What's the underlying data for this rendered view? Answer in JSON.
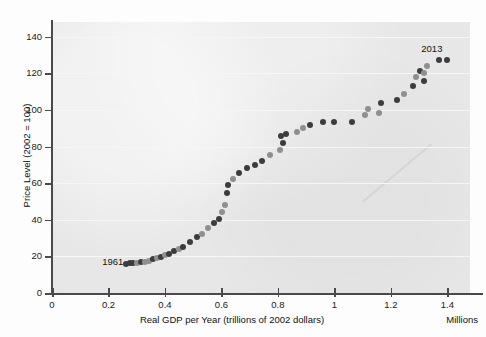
{
  "chart_data": {
    "type": "scatter",
    "title": "",
    "xlabel": "Real GDP per Year (trillions of 2002 dollars)",
    "xunit": "Millions",
    "ylabel": "Price Level (2002 = 100)",
    "xlim": [
      0,
      1.48
    ],
    "ylim": [
      0,
      148
    ],
    "xticks": [
      0,
      0.2,
      0.4,
      0.6,
      0.8,
      1,
      1.2,
      1.4
    ],
    "xtick_labels": [
      "0",
      "0.2",
      "0.4",
      "0.6",
      "0.8",
      "1",
      "1.2",
      "1.4"
    ],
    "yticks": [
      0,
      20,
      40,
      60,
      80,
      100,
      120,
      140
    ],
    "ytick_labels": [
      "0",
      "20",
      "40",
      "60",
      "80",
      "100",
      "120",
      "140"
    ],
    "grid": "horizontal",
    "legend": "none",
    "marker_colors": [
      "#3c3c3c",
      "#8f8f8f"
    ],
    "annotations": [
      {
        "label": "1961",
        "x": 0.215,
        "y": 17.5
      },
      {
        "label": "2013",
        "x": 1.345,
        "y": 134.0
      }
    ],
    "series": [
      {
        "name": "Price level vs real GDP",
        "points": [
          {
            "year": 1961,
            "x": 0.262,
            "y": 16.0,
            "shade": 0
          },
          {
            "year": 1962,
            "x": 0.276,
            "y": 16.2,
            "shade": 0
          },
          {
            "year": 1963,
            "x": 0.288,
            "y": 16.4,
            "shade": 0
          },
          {
            "year": 1964,
            "x": 0.3,
            "y": 16.5,
            "shade": 1
          },
          {
            "year": 1965,
            "x": 0.316,
            "y": 16.7,
            "shade": 0
          },
          {
            "year": 1966,
            "x": 0.33,
            "y": 17.0,
            "shade": 1
          },
          {
            "year": 1967,
            "x": 0.345,
            "y": 17.6,
            "shade": 1
          },
          {
            "year": 1968,
            "x": 0.358,
            "y": 18.3,
            "shade": 0
          },
          {
            "year": 1969,
            "x": 0.372,
            "y": 19.0,
            "shade": 1
          },
          {
            "year": 1970,
            "x": 0.386,
            "y": 19.8,
            "shade": 0
          },
          {
            "year": 1971,
            "x": 0.4,
            "y": 20.7,
            "shade": 1
          },
          {
            "year": 1972,
            "x": 0.414,
            "y": 21.5,
            "shade": 0
          },
          {
            "year": 1973,
            "x": 0.432,
            "y": 22.7,
            "shade": 0
          },
          {
            "year": 1974,
            "x": 0.448,
            "y": 24.0,
            "shade": 1
          },
          {
            "year": 1975,
            "x": 0.464,
            "y": 25.3,
            "shade": 0
          },
          {
            "year": 1976,
            "x": 0.489,
            "y": 28.0,
            "shade": 0
          },
          {
            "year": 1977,
            "x": 0.512,
            "y": 30.5,
            "shade": 0
          },
          {
            "year": 1978,
            "x": 0.53,
            "y": 32.3,
            "shade": 1
          },
          {
            "year": 1979,
            "x": 0.552,
            "y": 35.4,
            "shade": 1
          },
          {
            "year": 1980,
            "x": 0.572,
            "y": 38.5,
            "shade": 0
          },
          {
            "year": 1981,
            "x": 0.592,
            "y": 40.5,
            "shade": 0
          },
          {
            "year": 1982,
            "x": 0.602,
            "y": 44.0,
            "shade": 1
          },
          {
            "year": 1983,
            "x": 0.612,
            "y": 48.2,
            "shade": 1
          },
          {
            "year": 1984,
            "x": 0.62,
            "y": 54.5,
            "shade": 0
          },
          {
            "year": 1985,
            "x": 0.622,
            "y": 59.2,
            "shade": 0
          },
          {
            "year": 1986,
            "x": 0.64,
            "y": 62.5,
            "shade": 1
          },
          {
            "year": 1987,
            "x": 0.662,
            "y": 65.5,
            "shade": 0
          },
          {
            "year": 1988,
            "x": 0.692,
            "y": 68.3,
            "shade": 0
          },
          {
            "year": 1989,
            "x": 0.718,
            "y": 70.0,
            "shade": 0
          },
          {
            "year": 1990,
            "x": 0.742,
            "y": 72.3,
            "shade": 0
          },
          {
            "year": 1991,
            "x": 0.772,
            "y": 75.5,
            "shade": 1
          },
          {
            "year": 1992,
            "x": 0.806,
            "y": 78.0,
            "shade": 1
          },
          {
            "year": 1993,
            "x": 0.818,
            "y": 82.0,
            "shade": 0
          },
          {
            "year": 1994,
            "x": 0.812,
            "y": 85.5,
            "shade": 0
          },
          {
            "year": 1995,
            "x": 0.828,
            "y": 87.0,
            "shade": 0
          },
          {
            "year": 1996,
            "x": 0.868,
            "y": 88.0,
            "shade": 1
          },
          {
            "year": 1997,
            "x": 0.89,
            "y": 90.2,
            "shade": 1
          },
          {
            "year": 1998,
            "x": 0.915,
            "y": 91.5,
            "shade": 0
          },
          {
            "year": 1999,
            "x": 0.958,
            "y": 93.3,
            "shade": 0
          },
          {
            "year": 2000,
            "x": 1.0,
            "y": 93.4,
            "shade": 0
          },
          {
            "year": 2001,
            "x": 1.062,
            "y": 93.2,
            "shade": 0
          },
          {
            "year": 2002,
            "x": 1.108,
            "y": 97.0,
            "shade": 1
          },
          {
            "year": 2003,
            "x": 1.118,
            "y": 100.5,
            "shade": 1
          },
          {
            "year": 2004,
            "x": 1.158,
            "y": 98.5,
            "shade": 1
          },
          {
            "year": 2005,
            "x": 1.165,
            "y": 103.5,
            "shade": 0
          },
          {
            "year": 2006,
            "x": 1.222,
            "y": 105.5,
            "shade": 0
          },
          {
            "year": 2007,
            "x": 1.248,
            "y": 108.8,
            "shade": 1
          },
          {
            "year": 2008,
            "x": 1.278,
            "y": 113.0,
            "shade": 0
          },
          {
            "year": 2009,
            "x": 1.29,
            "y": 118.0,
            "shade": 1
          },
          {
            "year": 2010,
            "x": 1.302,
            "y": 121.5,
            "shade": 0
          },
          {
            "year": 2011,
            "x": 1.318,
            "y": 116.0,
            "shade": 0
          },
          {
            "year": 2012,
            "x": 1.318,
            "y": 120.0,
            "shade": 1
          },
          {
            "year": 2013,
            "x": 1.328,
            "y": 124.0,
            "shade": 1
          },
          {
            "year": 2013,
            "x": 1.372,
            "y": 127.0,
            "shade": 0
          },
          {
            "year": 2013,
            "x": 1.398,
            "y": 127.2,
            "shade": 0
          }
        ]
      }
    ]
  }
}
